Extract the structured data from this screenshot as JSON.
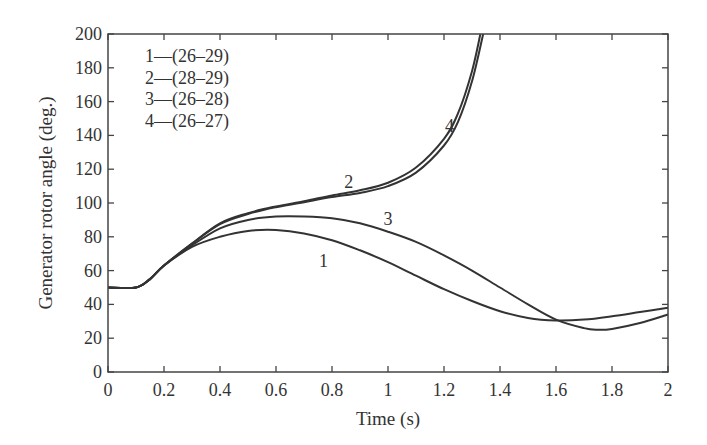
{
  "chart_data": {
    "type": "line",
    "title": "",
    "xlabel": "Time (s)",
    "ylabel": "Generator rotor angle (deg.)",
    "xlim": [
      0,
      2
    ],
    "ylim": [
      0,
      200
    ],
    "grid": false,
    "x_ticks": [
      "0",
      "0.2",
      "0.4",
      "0.6",
      "0.8",
      "1",
      "1.2",
      "1.4",
      "1.6",
      "1.8",
      "2"
    ],
    "y_ticks": [
      "0",
      "20",
      "40",
      "60",
      "80",
      "100",
      "120",
      "140",
      "160",
      "180",
      "200"
    ],
    "legend_position": "top-left (inside)",
    "legend": [
      "1—(26–29)",
      "2—(28–29)",
      "3—(26–28)",
      "4—(26–27)"
    ],
    "series": [
      {
        "name": "1—(26–29)",
        "label": "1",
        "label_at": [
          0.77,
          62
        ],
        "x": [
          0,
          0.1,
          0.15,
          0.2,
          0.3,
          0.4,
          0.5,
          0.6,
          0.7,
          0.8,
          0.9,
          1.0,
          1.1,
          1.2,
          1.3,
          1.4,
          1.5,
          1.6,
          1.7,
          1.8,
          1.9,
          2.0
        ],
        "values": [
          50,
          50,
          55,
          63,
          74,
          80,
          83.5,
          84,
          82,
          78,
          72,
          65,
          57,
          49,
          42,
          36,
          32,
          30.5,
          31,
          33,
          35.5,
          38
        ]
      },
      {
        "name": "2—(28–29)",
        "label": "2",
        "label_at": [
          0.86,
          109
        ],
        "x": [
          0,
          0.1,
          0.15,
          0.2,
          0.3,
          0.4,
          0.5,
          0.6,
          0.7,
          0.8,
          0.9,
          1.0,
          1.1,
          1.2,
          1.25,
          1.3,
          1.33
        ],
        "values": [
          50,
          50,
          55,
          63,
          76,
          88,
          94,
          98,
          101,
          104.5,
          107.5,
          112,
          121,
          138,
          153,
          178,
          200
        ]
      },
      {
        "name": "3—(26–28)",
        "label": "3",
        "label_at": [
          1.0,
          87
        ],
        "x": [
          0,
          0.1,
          0.15,
          0.2,
          0.3,
          0.4,
          0.5,
          0.6,
          0.7,
          0.8,
          0.9,
          1.0,
          1.1,
          1.2,
          1.3,
          1.4,
          1.5,
          1.6,
          1.7,
          1.75,
          1.8,
          1.9,
          2.0
        ],
        "values": [
          50,
          50,
          55,
          63,
          75,
          85,
          90,
          92,
          92,
          91,
          88,
          83,
          77,
          69,
          60,
          50,
          40,
          31,
          26,
          25,
          25.5,
          29,
          34
        ]
      },
      {
        "name": "4—(26–27)",
        "label": "4",
        "label_at": [
          1.22,
          142
        ],
        "x": [
          0,
          0.1,
          0.15,
          0.2,
          0.3,
          0.4,
          0.5,
          0.6,
          0.7,
          0.8,
          0.9,
          1.0,
          1.1,
          1.2,
          1.25,
          1.3,
          1.34
        ],
        "values": [
          50,
          50,
          55,
          63,
          76,
          87.5,
          93.5,
          97.5,
          100.5,
          103.5,
          106,
          110,
          118,
          134,
          148,
          172,
          200
        ]
      }
    ]
  },
  "colors": {
    "line": "#333333",
    "axis": "#444444",
    "text": "#333333",
    "background": "#ffffff"
  }
}
